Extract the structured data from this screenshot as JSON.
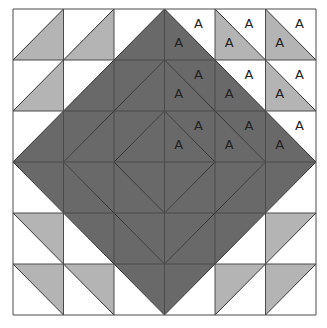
{
  "diagram": {
    "rows": 6,
    "cols": 6,
    "origin": [
      13,
      9
    ],
    "cell_w": 50.5,
    "cell_h": 51,
    "colors": {
      "white": "#ffffff",
      "light": "#b4b4b4",
      "dark": "#696969",
      "line": "#333333"
    },
    "label_text": "A",
    "cells": [
      {
        "r": 0,
        "c": 0,
        "diag": "/",
        "a": "white",
        "b": "light"
      },
      {
        "r": 0,
        "c": 1,
        "diag": "/",
        "a": "white",
        "b": "light"
      },
      {
        "r": 0,
        "c": 2,
        "diag": "/",
        "a": "white",
        "b": "dark"
      },
      {
        "r": 0,
        "c": 3,
        "diag": "\\",
        "a": "white",
        "b": "dark",
        "labels": true
      },
      {
        "r": 0,
        "c": 4,
        "diag": "\\",
        "a": "white",
        "b": "light",
        "labels": true
      },
      {
        "r": 0,
        "c": 5,
        "diag": "\\",
        "a": "white",
        "b": "light",
        "labels": true
      },
      {
        "r": 1,
        "c": 0,
        "diag": "/",
        "a": "white",
        "b": "light"
      },
      {
        "r": 1,
        "c": 1,
        "diag": "/",
        "a": "white",
        "b": "dark"
      },
      {
        "r": 1,
        "c": 2,
        "diag": "/",
        "a": "dark",
        "b": "dark"
      },
      {
        "r": 1,
        "c": 3,
        "diag": "\\",
        "a": "dark",
        "b": "dark",
        "labels": true
      },
      {
        "r": 1,
        "c": 4,
        "diag": "\\",
        "a": "white",
        "b": "dark",
        "labels": true
      },
      {
        "r": 1,
        "c": 5,
        "diag": "\\",
        "a": "white",
        "b": "light",
        "labels": true
      },
      {
        "r": 2,
        "c": 0,
        "diag": "/",
        "a": "white",
        "b": "dark"
      },
      {
        "r": 2,
        "c": 1,
        "diag": "/",
        "a": "dark",
        "b": "dark"
      },
      {
        "r": 2,
        "c": 2,
        "diag": "/",
        "a": "dark",
        "b": "dark"
      },
      {
        "r": 2,
        "c": 3,
        "diag": "\\",
        "a": "dark",
        "b": "dark",
        "labels": true
      },
      {
        "r": 2,
        "c": 4,
        "diag": "\\",
        "a": "dark",
        "b": "dark",
        "labels": true
      },
      {
        "r": 2,
        "c": 5,
        "diag": "\\",
        "a": "white",
        "b": "dark",
        "labels": true
      },
      {
        "r": 3,
        "c": 0,
        "diag": "\\",
        "a": "dark",
        "b": "white"
      },
      {
        "r": 3,
        "c": 1,
        "diag": "\\",
        "a": "dark",
        "b": "dark"
      },
      {
        "r": 3,
        "c": 2,
        "diag": "\\",
        "a": "dark",
        "b": "dark"
      },
      {
        "r": 3,
        "c": 3,
        "diag": "/",
        "a": "dark",
        "b": "dark"
      },
      {
        "r": 3,
        "c": 4,
        "diag": "/",
        "a": "dark",
        "b": "dark"
      },
      {
        "r": 3,
        "c": 5,
        "diag": "/",
        "a": "dark",
        "b": "white"
      },
      {
        "r": 4,
        "c": 0,
        "diag": "\\",
        "a": "light",
        "b": "white"
      },
      {
        "r": 4,
        "c": 1,
        "diag": "\\",
        "a": "dark",
        "b": "white"
      },
      {
        "r": 4,
        "c": 2,
        "diag": "\\",
        "a": "dark",
        "b": "dark"
      },
      {
        "r": 4,
        "c": 3,
        "diag": "/",
        "a": "dark",
        "b": "dark"
      },
      {
        "r": 4,
        "c": 4,
        "diag": "/",
        "a": "dark",
        "b": "white"
      },
      {
        "r": 4,
        "c": 5,
        "diag": "/",
        "a": "light",
        "b": "white"
      },
      {
        "r": 5,
        "c": 0,
        "diag": "\\",
        "a": "light",
        "b": "white"
      },
      {
        "r": 5,
        "c": 1,
        "diag": "\\",
        "a": "light",
        "b": "white"
      },
      {
        "r": 5,
        "c": 2,
        "diag": "\\",
        "a": "dark",
        "b": "white"
      },
      {
        "r": 5,
        "c": 3,
        "diag": "/",
        "a": "dark",
        "b": "white"
      },
      {
        "r": 5,
        "c": 4,
        "diag": "/",
        "a": "light",
        "b": "white"
      },
      {
        "r": 5,
        "c": 5,
        "diag": "/",
        "a": "light",
        "b": "white"
      }
    ],
    "legend_note": "a = upper triangle (upper-left for '/', upper-right for '\\'); b = lower triangle"
  }
}
